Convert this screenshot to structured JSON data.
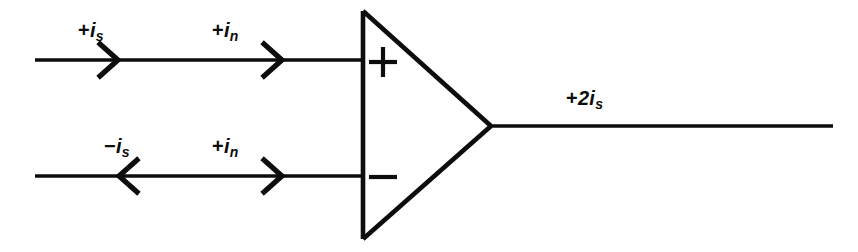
{
  "diagram": {
    "type": "circuit-schematic",
    "stroke_color": "#0d0d0d",
    "background_color": "#ffffff",
    "amplifier": {
      "name": "differential-amplifier",
      "shape": "triangle",
      "noninverting_symbol": "+",
      "inverting_symbol": "−"
    },
    "labels": {
      "top_signal": {
        "sign": "+",
        "symbol": "i",
        "subscript": "s"
      },
      "top_noise": {
        "sign": "+",
        "symbol": "i",
        "subscript": "n"
      },
      "bottom_signal": {
        "sign": "−",
        "symbol": "i",
        "subscript": "s"
      },
      "bottom_noise": {
        "sign": "+",
        "symbol": "i",
        "subscript": "n"
      },
      "output": {
        "sign": "+",
        "coefficient": "2",
        "symbol": "i",
        "subscript": "s"
      }
    },
    "arrows": {
      "top_signal_direction": "right",
      "top_noise_direction": "right",
      "bottom_signal_direction": "left",
      "bottom_noise_direction": "right",
      "output_direction": "none"
    }
  }
}
